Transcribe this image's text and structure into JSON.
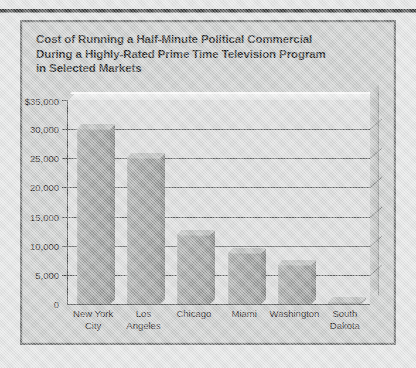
{
  "page": {
    "background_color": "#e2e3e3",
    "panel_color": "#c9cbca",
    "panel_border_color": "#6e7070",
    "plot_background_color": "#d8d9d9",
    "bar_color": "#9b9d9c",
    "text_color": "#1f2020",
    "gridline_color": "#5d5f5f"
  },
  "chart_title": {
    "line1": "Cost of Running a Half-Minute Political Commercial",
    "line2": "During a Highly-Rated Prime Time Television Program",
    "line3": "in Selected Markets"
  },
  "chart_data": {
    "type": "bar",
    "title": "Cost of Running a Half-Minute Political Commercial During a Highly-Rated Prime Time Television Program in Selected Markets",
    "xlabel": "",
    "ylabel": "",
    "categories": [
      "New York\nCity",
      "Los\nAngeles",
      "Chicago",
      "Miami",
      "Washington",
      "South\nDakota"
    ],
    "values": [
      30000,
      25000,
      11800,
      8800,
      6700,
      400
    ],
    "ylim": [
      0,
      35000
    ],
    "ytick_values": [
      0,
      5000,
      10000,
      15000,
      20000,
      25000,
      30000,
      35000
    ],
    "ytick_labels": [
      "0",
      "5,000",
      "10,000",
      "15,000",
      "20,000",
      "25,000",
      "30,000",
      "$35,000"
    ],
    "grid": true,
    "legend": null,
    "style": "3d-wall"
  }
}
